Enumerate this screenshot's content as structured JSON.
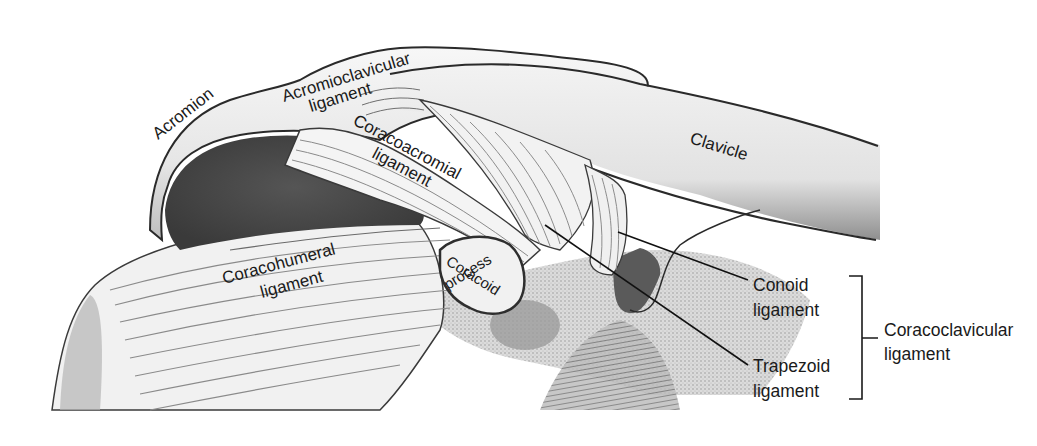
{
  "figure": {
    "colors": {
      "background": "#ffffff",
      "ink": "#1a1a1a",
      "bone_light": "#efefef",
      "bone_mid": "#cfcfcf",
      "shadow_dark": "#5a5a5a",
      "shadow_deep": "#3c3c3c",
      "ligament": "#f4f4f4",
      "fiber": "#8a8a8a"
    }
  },
  "labels": {
    "acromion": "Acromion",
    "acromioclavicular_l1": "Acromioclavicular",
    "acromioclavicular_l2": "ligament",
    "coracoacromial_l1": "Coracoacromial",
    "coracoacromial_l2": "ligament",
    "clavicle": "Clavicle",
    "coracohumeral_l1": "Coracohumeral",
    "coracohumeral_l2": "ligament",
    "coracoid_l1": "Coracoid",
    "coracoid_l2": "process",
    "conoid_l1": "Conoid",
    "conoid_l2": "ligament",
    "trapezoid_l1": "Trapezoid",
    "trapezoid_l2": "ligament",
    "coracoclavicular_l1": "Coracoclavicular",
    "coracoclavicular_l2": "ligament"
  }
}
